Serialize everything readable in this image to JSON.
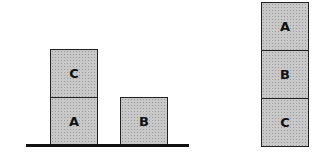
{
  "diagram": {
    "initial_state": {
      "blocks": [
        {
          "label": "C",
          "x": 50,
          "y": 49,
          "w": 48,
          "h": 48
        },
        {
          "label": "A",
          "x": 50,
          "y": 97,
          "w": 48,
          "h": 48
        },
        {
          "label": "B",
          "x": 120,
          "y": 97,
          "w": 48,
          "h": 48
        }
      ],
      "ground": {
        "x": 26,
        "y": 144,
        "w": 163,
        "h": 3
      }
    },
    "goal_state": {
      "blocks": [
        {
          "label": "A",
          "x": 261,
          "y": 2,
          "w": 48,
          "h": 49
        },
        {
          "label": "B",
          "x": 261,
          "y": 50,
          "w": 48,
          "h": 49
        },
        {
          "label": "C",
          "x": 261,
          "y": 98,
          "w": 48,
          "h": 49
        }
      ]
    },
    "colors": {
      "block_fill": "#c8c8c8",
      "border": "#222222",
      "ground": "#111111"
    }
  }
}
